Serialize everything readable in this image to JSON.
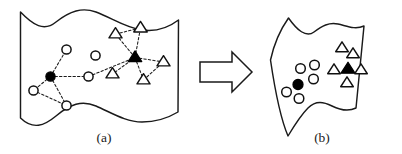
{
  "figure": {
    "width": 402,
    "height": 154,
    "background": "#ffffff",
    "ink_color": "#1a1a1a",
    "fill_color": "#000000",
    "open_fill": "#ffffff"
  },
  "panels": [
    {
      "id": "panel-a",
      "caption": "(a)",
      "caption_x": 104,
      "caption_y": 142,
      "outline_path": "M 20.5 12 L 20.5 118 C 33 130 44 126 56 116 C 70 104 82 100 96 106 C 112 113 126 122 142 122 C 156 122 168 118 178 112 L 178.5 20 C 168 28 156 32 142 30 C 126 28 112 18 96 12 C 82 7 70 11 56 22 C 44 32 33 25 20.5 12 Z",
      "nodes": [
        {
          "name": "hub-circle",
          "shape": "circle",
          "fill": "solid",
          "cx": 50.5,
          "cy": 76.5,
          "r": 4.6
        },
        {
          "name": "circle-1",
          "shape": "circle",
          "fill": "open",
          "cx": 66.5,
          "cy": 49.5,
          "r": 4.6
        },
        {
          "name": "circle-2",
          "shape": "circle",
          "fill": "open",
          "cx": 33.5,
          "cy": 90.5,
          "r": 4.6
        },
        {
          "name": "circle-3",
          "shape": "circle",
          "fill": "open",
          "cx": 66.5,
          "cy": 105.5,
          "r": 4.6
        },
        {
          "name": "circle-4",
          "shape": "circle",
          "fill": "open",
          "cx": 88.5,
          "cy": 76.5,
          "r": 4.6
        },
        {
          "name": "circle-5",
          "shape": "circle",
          "fill": "open",
          "cx": 95.5,
          "cy": 55.5,
          "r": 4.6
        },
        {
          "name": "hub-triangle",
          "shape": "triangle",
          "fill": "solid",
          "cx": 135.0,
          "cy": 57.5,
          "r": 6.4
        },
        {
          "name": "triangle-1",
          "shape": "triangle",
          "fill": "open",
          "cx": 115.5,
          "cy": 34.0,
          "r": 6.2
        },
        {
          "name": "triangle-2",
          "shape": "triangle",
          "fill": "open",
          "cx": 140.5,
          "cy": 28.0,
          "r": 6.4
        },
        {
          "name": "triangle-3",
          "shape": "triangle",
          "fill": "open",
          "cx": 112.5,
          "cy": 74.0,
          "r": 6.2
        },
        {
          "name": "triangle-4",
          "shape": "triangle",
          "fill": "open",
          "cx": 143.5,
          "cy": 80.0,
          "r": 6.2
        },
        {
          "name": "triangle-5",
          "shape": "triangle",
          "fill": "open",
          "cx": 163.5,
          "cy": 62.0,
          "r": 6.2
        }
      ],
      "edges": [
        {
          "from": "hub-circle",
          "to": "circle-1"
        },
        {
          "from": "hub-circle",
          "to": "circle-2"
        },
        {
          "from": "hub-circle",
          "to": "circle-3"
        },
        {
          "from": "hub-circle",
          "to": "circle-4"
        },
        {
          "from": "circle-2",
          "to": "circle-3"
        },
        {
          "from": "circle-4",
          "to": "hub-triangle"
        },
        {
          "from": "hub-triangle",
          "to": "triangle-1"
        },
        {
          "from": "hub-triangle",
          "to": "triangle-2"
        },
        {
          "from": "hub-triangle",
          "to": "triangle-3"
        },
        {
          "from": "hub-triangle",
          "to": "triangle-4"
        },
        {
          "from": "hub-triangle",
          "to": "triangle-5"
        },
        {
          "from": "triangle-1",
          "to": "triangle-2"
        },
        {
          "from": "triangle-4",
          "to": "triangle-5"
        }
      ]
    },
    {
      "id": "panel-b",
      "caption": "(b)",
      "caption_x": 322,
      "caption_y": 142,
      "outline_path": "M 270.5 60 C 274 44 280 30 288.5 18 C 297 30 306 38 314 32 C 322 26 329 22 338 24 C 347 26 355 30 364 26 L 356 108 C 348 112 340 110 332 106 C 324 102 316 100 308 108 C 300 116 294 126 288 136 C 282 122 277 104 270.5 60 Z",
      "nodes": [
        {
          "name": "cluster-circle-filled",
          "shape": "circle",
          "fill": "solid",
          "cx": 298.0,
          "cy": 84.5,
          "r": 5.0
        },
        {
          "name": "cluster-circle-1",
          "shape": "circle",
          "fill": "open",
          "cx": 300.5,
          "cy": 68.5,
          "r": 4.8
        },
        {
          "name": "cluster-circle-2",
          "shape": "circle",
          "fill": "open",
          "cx": 314.5,
          "cy": 65.0,
          "r": 4.8
        },
        {
          "name": "cluster-circle-3",
          "shape": "circle",
          "fill": "open",
          "cx": 313.5,
          "cy": 79.0,
          "r": 4.8
        },
        {
          "name": "cluster-circle-4",
          "shape": "circle",
          "fill": "open",
          "cx": 286.5,
          "cy": 92.0,
          "r": 4.8
        },
        {
          "name": "cluster-circle-5",
          "shape": "circle",
          "fill": "open",
          "cx": 299.0,
          "cy": 98.5,
          "r": 4.8
        },
        {
          "name": "cluster-triangle-filled",
          "shape": "triangle",
          "fill": "solid",
          "cx": 348.0,
          "cy": 69.0,
          "r": 6.6
        },
        {
          "name": "cluster-triangle-1",
          "shape": "triangle",
          "fill": "open",
          "cx": 342.0,
          "cy": 48.0,
          "r": 6.0
        },
        {
          "name": "cluster-triangle-2",
          "shape": "triangle",
          "fill": "open",
          "cx": 353.0,
          "cy": 54.0,
          "r": 6.0
        },
        {
          "name": "cluster-triangle-3",
          "shape": "triangle",
          "fill": "open",
          "cx": 334.0,
          "cy": 70.0,
          "r": 6.0
        },
        {
          "name": "cluster-triangle-4",
          "shape": "triangle",
          "fill": "open",
          "cx": 361.0,
          "cy": 70.0,
          "r": 6.0
        },
        {
          "name": "cluster-triangle-5",
          "shape": "triangle",
          "fill": "open",
          "cx": 347.0,
          "cy": 83.0,
          "r": 6.0
        }
      ],
      "edges": []
    }
  ],
  "arrow": {
    "name": "transition-arrow",
    "direction": "right",
    "path": "M 200 62 L 232 62 L 232 52 L 252 72 L 232 92 L 232 82 L 200 82 Z"
  }
}
